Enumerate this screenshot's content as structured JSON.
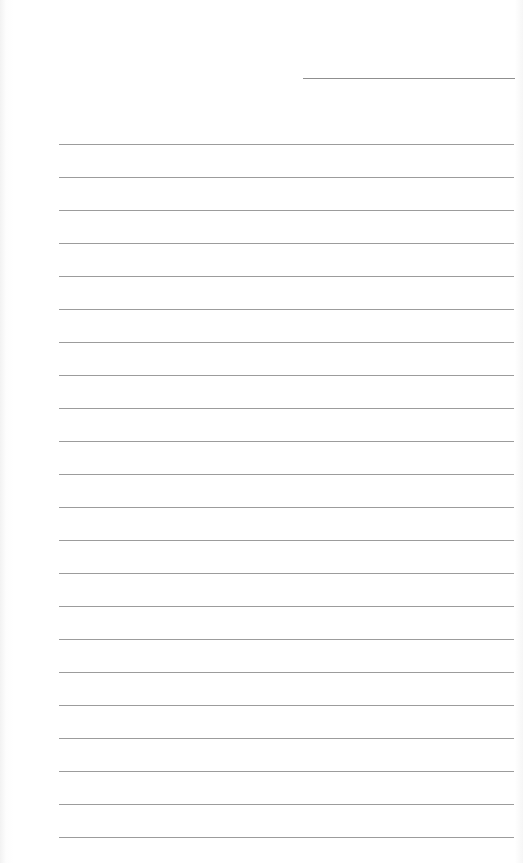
{
  "document": {
    "type": "lined-paper",
    "date_line": {
      "label": ""
    },
    "ruled_lines": {
      "count": 22,
      "first_y": 144,
      "spacing": 33,
      "left": 59,
      "width": 455
    },
    "colors": {
      "paper": "#ffffff",
      "rule": "#9c9c9c",
      "date_rule": "#8f8f8f"
    },
    "lines": [
      "",
      "",
      "",
      "",
      "",
      "",
      "",
      "",
      "",
      "",
      "",
      "",
      "",
      "",
      "",
      "",
      "",
      "",
      "",
      "",
      "",
      ""
    ]
  }
}
